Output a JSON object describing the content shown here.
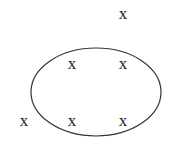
{
  "diagram": {
    "ellipse": {
      "cx": 96,
      "cy": 92,
      "rx": 65,
      "ry": 44,
      "stroke": "#333333"
    },
    "marks": [
      {
        "label": "x",
        "x": 123,
        "y": 19,
        "position": "outside"
      },
      {
        "label": "x",
        "x": 72,
        "y": 69,
        "position": "inside"
      },
      {
        "label": "x",
        "x": 123,
        "y": 69,
        "position": "inside"
      },
      {
        "label": "x",
        "x": 24,
        "y": 126,
        "position": "outside"
      },
      {
        "label": "x",
        "x": 72,
        "y": 126,
        "position": "inside"
      },
      {
        "label": "x",
        "x": 123,
        "y": 126,
        "position": "inside"
      }
    ]
  }
}
